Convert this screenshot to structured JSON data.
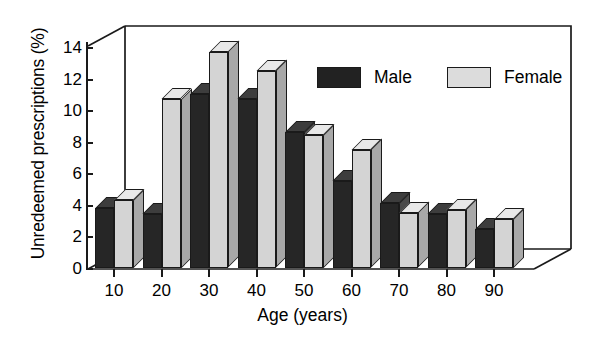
{
  "chart_data": {
    "type": "bar",
    "title": "",
    "subtitle": "",
    "xlabel": "Age (years)",
    "ylabel": "Unredeemed prescriptions (%)",
    "categories": [
      "10",
      "20",
      "30",
      "40",
      "50",
      "60",
      "70",
      "80",
      "90"
    ],
    "series": [
      {
        "name": "Male",
        "color": "#262626",
        "values": [
          3.8,
          3.4,
          11.0,
          10.7,
          8.6,
          5.5,
          4.1,
          3.4,
          2.5
        ]
      },
      {
        "name": "Female",
        "color": "#d4d4d4",
        "values": [
          4.3,
          10.7,
          13.7,
          12.5,
          8.4,
          7.5,
          3.5,
          3.7,
          3.1
        ]
      }
    ],
    "ylim": [
      0,
      14
    ],
    "yticks": [
      0,
      2,
      4,
      6,
      8,
      10,
      12,
      14
    ],
    "ytick_labels": [
      "0",
      "2",
      "4",
      "6",
      "8",
      "10",
      "12",
      "14"
    ],
    "xtick_labels": [
      "10",
      "20",
      "30",
      "40",
      "50",
      "60",
      "70",
      "80",
      "90"
    ],
    "grid": false,
    "legend_position": "top-right",
    "style": "3d-clustered-bar",
    "legend": [
      {
        "label": "Male",
        "swatch": "dark-swatch"
      },
      {
        "label": "Female",
        "swatch": "light-swatch"
      }
    ]
  },
  "axes": {
    "y_title": "Unredeemed prescriptions (%)",
    "x_title": "Age (years)"
  }
}
